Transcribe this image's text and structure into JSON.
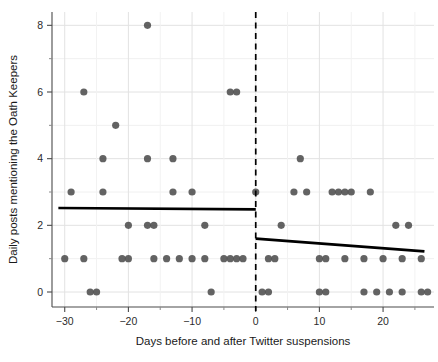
{
  "chart_data": {
    "type": "scatter",
    "title": "",
    "xlabel": "Days before and after Twitter suspensions",
    "ylabel": "Daily posts mentioning the Oath Keepers",
    "xlim": [
      -32,
      28
    ],
    "ylim": [
      -0.45,
      8.4
    ],
    "xticks": [
      -30,
      -20,
      -10,
      0,
      10,
      20
    ],
    "xtick_labels": [
      "−30",
      "−20",
      "−10",
      "0",
      "10",
      "20"
    ],
    "yticks": [
      0,
      2,
      4,
      6,
      8
    ],
    "ytick_labels": [
      "0",
      "2",
      "4",
      "6",
      "8"
    ],
    "y_minor_ticks": [
      1,
      3,
      5,
      7
    ],
    "grid": "major and minor horizontal and vertical gridlines, light gray",
    "legend": "none",
    "point_color": "#4d4d4d",
    "line_color": "#000000",
    "vline_color": "#000000",
    "annotations": [
      {
        "name": "suspension-cutoff",
        "type": "vertical-dashed-line",
        "x": 0,
        "label": ""
      }
    ],
    "points": [
      {
        "x": -30,
        "y": 1
      },
      {
        "x": -29,
        "y": 3
      },
      {
        "x": -27,
        "y": 6
      },
      {
        "x": -27,
        "y": 1
      },
      {
        "x": -26,
        "y": 0
      },
      {
        "x": -25,
        "y": 0
      },
      {
        "x": -24,
        "y": 4
      },
      {
        "x": -24,
        "y": 3
      },
      {
        "x": -22,
        "y": 5
      },
      {
        "x": -21,
        "y": 1
      },
      {
        "x": -20,
        "y": 1
      },
      {
        "x": -20,
        "y": 2
      },
      {
        "x": -17,
        "y": 8
      },
      {
        "x": -17,
        "y": 4
      },
      {
        "x": -17,
        "y": 2
      },
      {
        "x": -16,
        "y": 2
      },
      {
        "x": -16,
        "y": 1
      },
      {
        "x": -14,
        "y": 1
      },
      {
        "x": -13,
        "y": 4
      },
      {
        "x": -13,
        "y": 3
      },
      {
        "x": -12,
        "y": 1
      },
      {
        "x": -10,
        "y": 3
      },
      {
        "x": -10,
        "y": 1
      },
      {
        "x": -8,
        "y": 2
      },
      {
        "x": -8,
        "y": 1
      },
      {
        "x": -7,
        "y": 0
      },
      {
        "x": -5,
        "y": 1
      },
      {
        "x": -4,
        "y": 6
      },
      {
        "x": -3,
        "y": 6
      },
      {
        "x": -4,
        "y": 1
      },
      {
        "x": -3,
        "y": 1
      },
      {
        "x": -2,
        "y": 1
      },
      {
        "x": 0,
        "y": 3
      },
      {
        "x": 1,
        "y": 0
      },
      {
        "x": 2,
        "y": 0
      },
      {
        "x": 2,
        "y": 1
      },
      {
        "x": 3,
        "y": 1
      },
      {
        "x": 4,
        "y": 2
      },
      {
        "x": 6,
        "y": 3
      },
      {
        "x": 7,
        "y": 4
      },
      {
        "x": 8,
        "y": 3
      },
      {
        "x": 10,
        "y": 0
      },
      {
        "x": 11,
        "y": 0
      },
      {
        "x": 10,
        "y": 1
      },
      {
        "x": 11,
        "y": 1
      },
      {
        "x": 12,
        "y": 3
      },
      {
        "x": 13,
        "y": 3
      },
      {
        "x": 14,
        "y": 3
      },
      {
        "x": 15,
        "y": 3
      },
      {
        "x": 14,
        "y": 1
      },
      {
        "x": 17,
        "y": 0
      },
      {
        "x": 18,
        "y": 3
      },
      {
        "x": 19,
        "y": 0
      },
      {
        "x": 17,
        "y": 1
      },
      {
        "x": 21,
        "y": 0
      },
      {
        "x": 23,
        "y": 0
      },
      {
        "x": 22,
        "y": 2
      },
      {
        "x": 24,
        "y": 2
      },
      {
        "x": 20,
        "y": 1
      },
      {
        "x": 26,
        "y": 0
      },
      {
        "x": 27,
        "y": 0
      },
      {
        "x": 23,
        "y": 1
      },
      {
        "x": 26,
        "y": 1
      }
    ],
    "series": [
      {
        "name": "pre-suspension-fit",
        "type": "line",
        "x": [
          -31,
          0
        ],
        "values": [
          2.52,
          2.48
        ]
      },
      {
        "name": "post-suspension-fit",
        "type": "line",
        "x": [
          0,
          26.5
        ],
        "values": [
          1.6,
          1.22
        ]
      }
    ]
  }
}
